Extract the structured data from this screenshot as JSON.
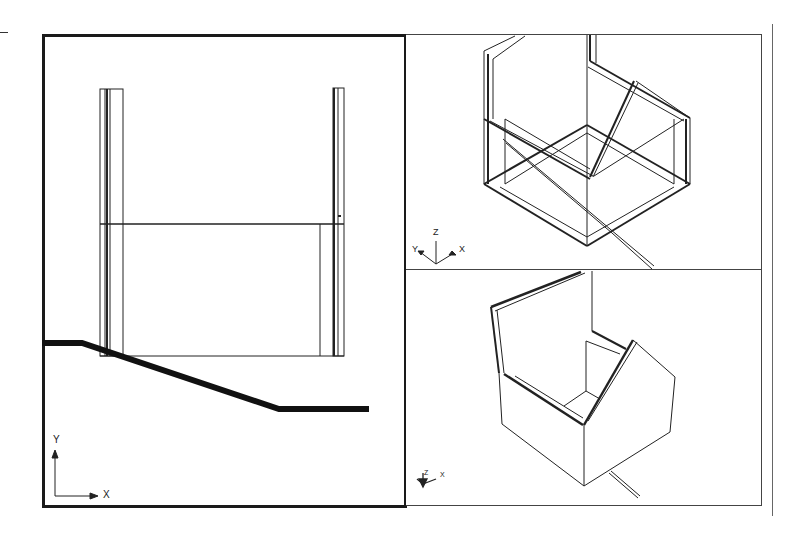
{
  "app": {
    "type": "cad-multi-viewport",
    "background_color": "#ffffff",
    "line_color": "#1a1a1a"
  },
  "viewports": [
    {
      "id": "left",
      "view": "plan",
      "active": true,
      "ucs_icon": {
        "type": "2d",
        "x_label": "X",
        "y_label": "Y"
      }
    },
    {
      "id": "top-right",
      "view": "isometric-wireframe",
      "active": false,
      "ucs_icon": {
        "type": "3d",
        "x_label": "X",
        "y_label": "Y",
        "z_label": "Z"
      }
    },
    {
      "id": "bottom-right",
      "view": "isometric-hidden",
      "active": false,
      "ucs_icon": {
        "type": "3d-small",
        "x_label": "X",
        "y_label": "Y",
        "z_label": "Z"
      }
    }
  ]
}
